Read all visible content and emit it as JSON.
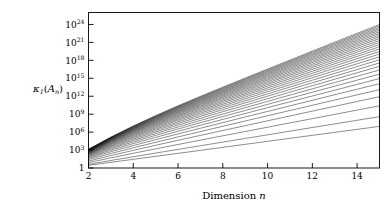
{
  "chart_data": {
    "type": "line",
    "title": "",
    "xlabel": "Dimension n",
    "ylabel": "κ₁(Aₙ)",
    "ylabel_parts": {
      "kappa": "κ",
      "kappa_sub": "1",
      "open_paren": "(",
      "matrix": "A",
      "matrix_sub": "n",
      "close_paren": ")"
    },
    "xlabel_parts": {
      "word": "Dimension",
      "variable": "n"
    },
    "xlim": [
      2,
      15
    ],
    "ylim": [
      1,
      1e+26
    ],
    "yscale": "log",
    "xscale": "linear",
    "grid": false,
    "legend": null,
    "x_ticks": [
      2,
      4,
      6,
      8,
      10,
      12,
      14
    ],
    "x_tick_labels": [
      "2",
      "4",
      "6",
      "8",
      "10",
      "12",
      "14"
    ],
    "y_ticks": [
      1,
      1000,
      1000000.0,
      1000000000.0,
      1000000000000.0,
      1000000000000000.0,
      1e+18,
      1e+21,
      1e+24
    ],
    "y_tick_labels": [
      {
        "base": "1",
        "exp": ""
      },
      {
        "base": "10",
        "exp": "3"
      },
      {
        "base": "10",
        "exp": "6"
      },
      {
        "base": "10",
        "exp": "9"
      },
      {
        "base": "10",
        "exp": "12"
      },
      {
        "base": "10",
        "exp": "15"
      },
      {
        "base": "10",
        "exp": "18"
      },
      {
        "base": "10",
        "exp": "21"
      },
      {
        "base": "10",
        "exp": "24"
      }
    ],
    "x": [
      2,
      3,
      4,
      5,
      6,
      7,
      8,
      9,
      10,
      11,
      12,
      13,
      14,
      15
    ],
    "series": [
      {
        "name": "curve-01",
        "log10_values": [
          0.45,
          0.95,
          1.45,
          1.95,
          2.45,
          2.95,
          3.45,
          3.96,
          4.46,
          4.96,
          5.46,
          5.96,
          6.46,
          6.96
        ]
      },
      {
        "name": "curve-02",
        "log10_values": [
          0.62,
          1.26,
          1.88,
          2.5,
          3.11,
          3.72,
          4.33,
          4.94,
          5.55,
          6.16,
          6.77,
          7.37,
          7.98,
          8.59
        ]
      },
      {
        "name": "curve-03",
        "log10_values": [
          0.9,
          1.7,
          2.46,
          3.2,
          3.93,
          4.66,
          5.38,
          6.1,
          6.82,
          7.54,
          8.25,
          8.97,
          9.68,
          10.4
        ]
      },
      {
        "name": "curve-04",
        "log10_values": [
          1.15,
          2.08,
          2.95,
          3.8,
          4.63,
          5.45,
          6.27,
          7.08,
          7.89,
          8.7,
          9.51,
          10.31,
          11.12,
          11.92
        ]
      },
      {
        "name": "curve-05",
        "log10_values": [
          1.4,
          2.42,
          3.38,
          4.3,
          5.2,
          6.09,
          6.98,
          7.86,
          8.74,
          9.61,
          10.49,
          11.36,
          12.23,
          13.1
        ]
      },
      {
        "name": "curve-06",
        "log10_values": [
          1.6,
          2.72,
          3.75,
          4.74,
          5.7,
          6.65,
          7.59,
          8.53,
          9.46,
          10.39,
          11.32,
          12.25,
          13.17,
          14.1
        ]
      },
      {
        "name": "curve-07",
        "log10_values": [
          1.78,
          2.98,
          4.08,
          5.12,
          6.14,
          7.14,
          8.13,
          9.11,
          10.09,
          11.07,
          12.04,
          13.01,
          13.98,
          14.95
        ]
      },
      {
        "name": "curve-08",
        "log10_values": [
          1.93,
          3.2,
          4.36,
          5.46,
          6.52,
          7.57,
          8.6,
          9.62,
          10.64,
          11.66,
          12.67,
          13.68,
          14.69,
          15.7
        ]
      },
      {
        "name": "curve-09",
        "log10_values": [
          2.06,
          3.4,
          4.61,
          5.76,
          6.86,
          7.95,
          9.02,
          10.08,
          11.14,
          12.19,
          13.24,
          14.29,
          15.34,
          16.38
        ]
      },
      {
        "name": "curve-10",
        "log10_values": [
          2.18,
          3.58,
          4.84,
          6.03,
          7.18,
          8.3,
          9.41,
          10.5,
          11.59,
          12.68,
          13.76,
          14.84,
          15.92,
          17.0
        ]
      },
      {
        "name": "curve-11",
        "log10_values": [
          2.28,
          3.74,
          5.05,
          6.28,
          7.46,
          8.62,
          9.76,
          10.89,
          12.01,
          13.13,
          14.24,
          15.35,
          16.46,
          17.57
        ]
      },
      {
        "name": "curve-12",
        "log10_values": [
          2.37,
          3.88,
          5.24,
          6.5,
          7.72,
          8.91,
          10.08,
          11.24,
          12.39,
          13.54,
          14.68,
          15.82,
          16.96,
          18.1
        ]
      },
      {
        "name": "curve-13",
        "log10_values": [
          2.45,
          4.01,
          5.41,
          6.71,
          7.96,
          9.18,
          10.38,
          11.57,
          12.75,
          13.92,
          15.09,
          16.26,
          17.42,
          18.59
        ]
      },
      {
        "name": "curve-14",
        "log10_values": [
          2.52,
          4.13,
          5.57,
          6.9,
          8.18,
          9.43,
          10.66,
          11.87,
          13.08,
          14.28,
          15.48,
          16.67,
          17.86,
          19.05
        ]
      },
      {
        "name": "curve-15",
        "log10_values": [
          2.59,
          4.24,
          5.72,
          7.08,
          8.39,
          9.66,
          10.92,
          12.16,
          13.39,
          14.62,
          15.84,
          17.06,
          18.27,
          19.48
        ]
      },
      {
        "name": "curve-16",
        "log10_values": [
          2.65,
          4.34,
          5.86,
          7.25,
          8.58,
          9.88,
          11.16,
          12.43,
          13.68,
          14.93,
          16.18,
          17.42,
          18.66,
          19.89
        ]
      },
      {
        "name": "curve-17",
        "log10_values": [
          2.7,
          4.43,
          5.98,
          7.4,
          8.76,
          10.09,
          11.39,
          12.68,
          13.96,
          15.23,
          16.5,
          17.76,
          19.02,
          20.27
        ]
      },
      {
        "name": "curve-18",
        "log10_values": [
          2.75,
          4.51,
          6.1,
          7.55,
          8.93,
          10.28,
          11.61,
          12.92,
          14.22,
          15.52,
          16.8,
          18.09,
          19.37,
          20.64
        ]
      },
      {
        "name": "curve-19",
        "log10_values": [
          2.8,
          4.59,
          6.2,
          7.68,
          9.09,
          10.46,
          11.81,
          13.14,
          14.47,
          15.78,
          17.09,
          18.4,
          19.7,
          20.99
        ]
      },
      {
        "name": "curve-20",
        "log10_values": [
          2.84,
          4.66,
          6.3,
          7.81,
          9.24,
          10.63,
          12.0,
          13.36,
          14.7,
          16.04,
          17.37,
          18.69,
          20.01,
          21.32
        ]
      },
      {
        "name": "curve-21",
        "log10_values": [
          2.88,
          4.73,
          6.39,
          7.93,
          9.38,
          10.79,
          12.18,
          13.56,
          14.92,
          16.28,
          17.63,
          18.97,
          20.31,
          21.64
        ]
      },
      {
        "name": "curve-22",
        "log10_values": [
          2.91,
          4.79,
          6.48,
          8.04,
          9.52,
          10.95,
          12.36,
          13.75,
          15.13,
          16.51,
          17.88,
          19.24,
          20.59,
          21.94
        ]
      },
      {
        "name": "curve-23",
        "log10_values": [
          2.95,
          4.85,
          6.56,
          8.15,
          9.65,
          11.09,
          12.52,
          13.93,
          15.34,
          16.73,
          18.12,
          19.5,
          20.87,
          22.23
        ]
      },
      {
        "name": "curve-24",
        "log10_values": [
          2.98,
          4.9,
          6.64,
          8.25,
          9.77,
          11.24,
          12.68,
          14.11,
          15.53,
          16.94,
          18.34,
          19.74,
          21.13,
          22.51
        ]
      },
      {
        "name": "curve-25",
        "log10_values": [
          3.01,
          4.95,
          6.71,
          8.34,
          9.89,
          11.37,
          12.83,
          14.28,
          15.72,
          17.14,
          18.56,
          19.98,
          21.38,
          22.78
        ]
      },
      {
        "name": "curve-26",
        "log10_values": [
          3.04,
          5.0,
          6.78,
          8.44,
          10.0,
          11.5,
          12.98,
          14.44,
          15.89,
          17.34,
          18.78,
          20.21,
          21.63,
          23.04
        ]
      },
      {
        "name": "curve-27",
        "log10_values": [
          3.06,
          5.05,
          6.85,
          8.52,
          10.11,
          11.63,
          13.12,
          14.6,
          16.07,
          17.53,
          18.98,
          20.42,
          21.86,
          23.29
        ]
      },
      {
        "name": "curve-28",
        "log10_values": [
          3.09,
          5.09,
          6.91,
          8.61,
          10.21,
          11.75,
          13.26,
          14.75,
          16.23,
          17.71,
          19.18,
          20.64,
          22.09,
          23.53
        ]
      },
      {
        "name": "curve-29",
        "log10_values": [
          3.11,
          5.13,
          6.97,
          8.69,
          10.31,
          11.87,
          13.39,
          14.9,
          16.4,
          17.88,
          19.36,
          20.84,
          22.31,
          23.77
        ]
      },
      {
        "name": "curve-30",
        "log10_values": [
          3.13,
          5.17,
          7.03,
          8.76,
          10.4,
          11.98,
          13.52,
          15.04,
          16.55,
          18.05,
          19.55,
          21.04,
          22.52,
          24.0
        ]
      }
    ]
  },
  "figure": {
    "frame_color": "#000000",
    "curve_color": "#000000",
    "background_color": "#ffffff"
  }
}
